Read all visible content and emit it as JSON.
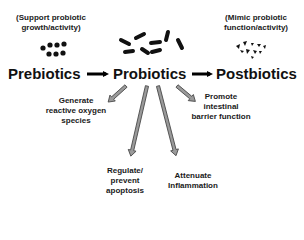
{
  "diagram": {
    "nodes": {
      "prebiotics": {
        "label": "Prebiotics",
        "note_line1": "(Support probiotic",
        "note_line2": "growth/activity)",
        "icon": "dots-cluster-icon"
      },
      "probiotics": {
        "label": "Probiotics",
        "icon": "rod-bacteria-icon"
      },
      "postbiotics": {
        "label": "Postbiotics",
        "note_line1": "(Mimic probiotic",
        "note_line2": "function/activity)",
        "icon": "fragments-cluster-icon"
      }
    },
    "effects": [
      {
        "line1": "Generate",
        "line2": "reactive oxygen",
        "line3": "species"
      },
      {
        "line1": "Regulate/",
        "line2": "prevent",
        "line3": "apoptosis"
      },
      {
        "line1": "Attenuate",
        "line2": "Inflammation"
      },
      {
        "line1": "Promote",
        "line2": "intestinal",
        "line3": "barrier function"
      }
    ],
    "edges": [
      {
        "from": "Prebiotics",
        "to": "Probiotics",
        "style": "black-arrow"
      },
      {
        "from": "Probiotics",
        "to": "Postbiotics",
        "style": "black-arrow"
      },
      {
        "from": "Probiotics",
        "to": "Generate reactive oxygen species",
        "style": "gray-outline-arrow"
      },
      {
        "from": "Probiotics",
        "to": "Regulate/prevent apoptosis",
        "style": "gray-outline-arrow"
      },
      {
        "from": "Probiotics",
        "to": "Attenuate Inflammation",
        "style": "gray-outline-arrow"
      },
      {
        "from": "Probiotics",
        "to": "Promote intestinal barrier function",
        "style": "gray-outline-arrow"
      }
    ],
    "colors": {
      "text": "#111111",
      "main_arrow": "#000000",
      "effect_arrow_fill": "#9a9a9a",
      "effect_arrow_stroke": "#444444"
    }
  }
}
